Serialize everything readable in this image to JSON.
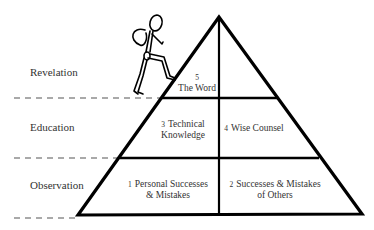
{
  "levels": [
    {
      "label": "Revelation"
    },
    {
      "label": "Education"
    },
    {
      "label": "Observation"
    }
  ],
  "cells": {
    "c5": {
      "number": "5",
      "line1": "The Word"
    },
    "c3": {
      "number": "3",
      "line1": "Technical",
      "line2": "Knowledge"
    },
    "c4": {
      "number": "4",
      "line1": "Wise Counsel"
    },
    "c1": {
      "number": "1",
      "line1": "Personal Successes",
      "line2": "& Mistakes"
    },
    "c2": {
      "number": "2",
      "line1": "Successes & Mistakes",
      "line2": "of Others"
    }
  },
  "colors": {
    "stroke": "#000000",
    "text": "#333333",
    "dash": "#555555"
  }
}
